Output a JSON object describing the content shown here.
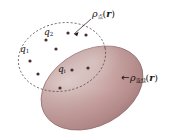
{
  "figure": {
    "caption_present": false,
    "background_color": "#ffffff",
    "ellipsoid": {
      "name": "continuous-charge-body",
      "fill_base": "#c9a0a0",
      "fill_highlight": "#e8d2cf",
      "fill_shadow": "#a87f80",
      "outline_color": "#7c5a5c",
      "center_x": 92,
      "center_y": 88,
      "radius_x": 54,
      "radius_y": 38,
      "rotation_deg": -28
    },
    "dashed_region": {
      "name": "point-charge-region",
      "stroke_color": "#4a4042",
      "dash_pattern": "2 2",
      "center_x": 62,
      "center_y": 57,
      "radius_x": 44,
      "radius_y": 34,
      "rotation_deg": -12
    },
    "point_charges": {
      "color": "#4b2f2f",
      "radius": 1.6,
      "points": [
        {
          "id": "p1",
          "x": 30,
          "y": 61
        },
        {
          "id": "p2",
          "x": 46,
          "y": 40
        },
        {
          "id": "p3",
          "x": 68,
          "y": 33
        },
        {
          "id": "p4",
          "x": 56,
          "y": 49
        },
        {
          "id": "p5",
          "x": 38,
          "y": 74
        },
        {
          "id": "p6",
          "x": 72,
          "y": 70
        },
        {
          "id": "p7",
          "x": 88,
          "y": 68
        },
        {
          "id": "p8",
          "x": 60,
          "y": 88
        },
        {
          "id": "p9",
          "x": 86,
          "y": 35
        }
      ]
    },
    "leader_lines": [
      {
        "name": "leader-rho-point",
        "x1": 91,
        "y1": 19,
        "x2": 74,
        "y2": 34,
        "color": "#1a1414"
      }
    ]
  },
  "labels": {
    "rho_point": {
      "symbol": "ρ",
      "subscript": "点",
      "argument_open": "(",
      "argument": "r",
      "argument_close": ")",
      "full_text": "ρ点(r)",
      "meaning": "point-charge-density"
    },
    "rho_continuous": {
      "symbol": "ρ",
      "subscript": "连续",
      "argument_open": "(",
      "argument": "r",
      "argument_close": ")",
      "full_text": "ρ连续(r)",
      "meaning": "continuous-charge-density"
    },
    "q1": {
      "symbol": "q",
      "subscript": "1",
      "full_text": "q1"
    },
    "q2": {
      "symbol": "q",
      "subscript": "2",
      "full_text": "q2"
    },
    "qi": {
      "symbol": "q",
      "subscript": "i",
      "full_text": "qi"
    },
    "arrow_continuous": {
      "glyph": "←",
      "meaning": "pointer-to-ellipsoid-surface"
    }
  }
}
